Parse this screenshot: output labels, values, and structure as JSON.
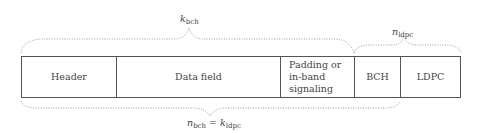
{
  "frame_fields": [
    {
      "label": "Header"
    },
    {
      "label": "Data field"
    },
    {
      "label": "Padding or in-band signaling",
      "lines": [
        "Padding or",
        "in-band",
        "signaling"
      ]
    },
    {
      "label": "BCH"
    },
    {
      "label": "LDPC"
    }
  ],
  "braces": {
    "top_left": {
      "symbol": "k",
      "subscript": "bch",
      "span": "Header + Data field + Padding or in-band signaling"
    },
    "top_right": {
      "symbol": "n",
      "subscript": "ldpc",
      "span": "BCH + LDPC"
    },
    "bottom": {
      "lhs_symbol": "n",
      "lhs_subscript": "bch",
      "equals": "=",
      "rhs_symbol": "k",
      "rhs_subscript": "ldpc",
      "span": "Header + Data field + Padding + BCH"
    }
  },
  "colors": {
    "line": "#555555",
    "brace": "#999999",
    "text": "#444444"
  }
}
